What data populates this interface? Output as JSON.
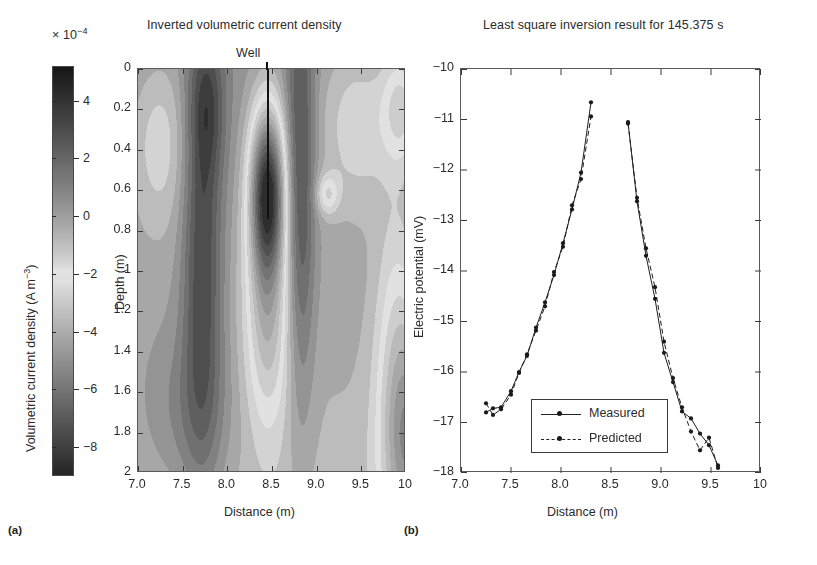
{
  "panels": {
    "a_label": "(a)",
    "b_label": "(b)"
  },
  "colorbar": {
    "exponent_prefix": "× 10",
    "exponent_value": "−4",
    "axis_label_main": "Volumetric current density (A m",
    "axis_label_exp": "−3",
    "axis_label_close": ")",
    "ticks": [
      "4",
      "2",
      "0",
      "−2",
      "−4",
      "−6",
      "−8"
    ],
    "tick_values": [
      4,
      2,
      0,
      -2,
      -4,
      -6,
      -8
    ],
    "range": [
      -9,
      5.2
    ]
  },
  "left": {
    "title": "Inverted volumetric current density",
    "well_label": "Well",
    "well_position_m": 8.45,
    "xlabel": "Distance (m)",
    "ylabel": "Depth (m)",
    "xticks": [
      "7.0",
      "7.5",
      "8.0",
      "8.5",
      "9.0",
      "9.5",
      "10"
    ],
    "xtick_values": [
      7.0,
      7.5,
      8.0,
      8.5,
      9.0,
      9.5,
      10.0
    ],
    "yticks": [
      "0",
      "0.2",
      "0.4",
      "0.6",
      "0.8",
      "1",
      "1.2",
      "1.4",
      "1.6",
      "1.8",
      "2"
    ],
    "ytick_values": [
      0,
      0.2,
      0.4,
      0.6,
      0.8,
      1.0,
      1.2,
      1.4,
      1.6,
      1.8,
      2.0
    ],
    "xlim": [
      7.0,
      10.0
    ],
    "ylim": [
      0,
      2
    ]
  },
  "right": {
    "title": "Least square inversion result for 145.375 s",
    "xlabel": "Distance (m)",
    "ylabel": "Electric potential (mV)",
    "xticks": [
      "7.0",
      "7.5",
      "8.0",
      "8.5",
      "9.0",
      "9.5",
      "10"
    ],
    "xtick_values": [
      7.0,
      7.5,
      8.0,
      8.5,
      9.0,
      9.5,
      10.0
    ],
    "yticks": [
      "−10",
      "−11",
      "−12",
      "−13",
      "−14",
      "−15",
      "−16",
      "−17",
      "−18"
    ],
    "ytick_values": [
      -10,
      -11,
      -12,
      -13,
      -14,
      -15,
      -16,
      -17,
      -18
    ],
    "xlim": [
      7.0,
      10.0
    ],
    "ylim": [
      -18,
      -10
    ],
    "legend": {
      "measured": "Measured",
      "predicted": "Predicted"
    }
  },
  "chart_data": [
    {
      "type": "heatmap",
      "title": "Inverted volumetric current density",
      "xlabel": "Distance (m)",
      "ylabel": "Depth (m)",
      "colorbar_label": "Volumetric current density (A m^-3)",
      "colorbar_exponent": "x 10^-4",
      "colorbar_ticks": [
        4,
        2,
        0,
        -2,
        -4,
        -6,
        -8
      ],
      "xlim": [
        7.0,
        10.0
      ],
      "ylim": [
        0,
        2
      ],
      "grid": false,
      "annotations": [
        {
          "text": "Well",
          "x": 8.45,
          "y": 0,
          "type": "vertical-line-marker"
        }
      ],
      "anomalies": [
        {
          "name": "primary-negative-anomaly",
          "x": 8.45,
          "depth": 0.6,
          "value": -8.5
        },
        {
          "name": "secondary-anomaly",
          "x": 9.12,
          "depth": 0.62,
          "value": -4.0
        }
      ],
      "field_nodes_x": [
        7.0,
        7.25,
        7.5,
        7.75,
        8.0,
        8.2,
        8.45,
        8.7,
        8.95,
        9.15,
        9.4,
        9.65,
        9.85,
        10.0
      ],
      "field_nodes_depth": [
        0,
        0.2,
        0.4,
        0.6,
        0.8,
        1.0,
        1.2,
        1.4,
        1.6,
        1.8,
        2.0
      ]
    },
    {
      "type": "line",
      "title": "Least square inversion result for 145.375 s",
      "xlabel": "Distance (m)",
      "ylabel": "Electric potential (mV)",
      "xlim": [
        7.0,
        10.0
      ],
      "ylim": [
        -18,
        -10
      ],
      "grid": false,
      "legend_position": "lower-center-left",
      "series": [
        {
          "name": "Measured",
          "style": "solid",
          "marker": "dot",
          "x": [
            7.25,
            7.32,
            7.4,
            7.5,
            7.58,
            7.66,
            7.75,
            7.84,
            7.93,
            8.02,
            8.11,
            8.2,
            8.3,
            8.67,
            8.76,
            8.85,
            8.94,
            9.03,
            9.12,
            9.21,
            9.3,
            9.39,
            9.48,
            9.57
          ],
          "y": [
            -16.8,
            -16.72,
            -16.7,
            -16.38,
            -16.0,
            -15.68,
            -15.12,
            -14.62,
            -14.08,
            -13.45,
            -12.78,
            -12.05,
            -10.66,
            -11.05,
            -12.62,
            -13.7,
            -14.55,
            -15.62,
            -16.2,
            -16.78,
            -16.92,
            -17.22,
            -17.45,
            -17.85
          ]
        },
        {
          "name": "Predicted",
          "style": "dashed",
          "marker": "dot",
          "x": [
            7.25,
            7.32,
            7.4,
            7.5,
            7.58,
            7.66,
            7.75,
            7.84,
            7.93,
            8.02,
            8.11,
            8.2,
            8.3,
            8.67,
            8.76,
            8.85,
            8.94,
            9.03,
            9.12,
            9.21,
            9.3,
            9.39,
            9.48,
            9.57
          ],
          "y": [
            -16.62,
            -16.85,
            -16.74,
            -16.45,
            -16.02,
            -15.65,
            -15.18,
            -14.7,
            -14.02,
            -13.52,
            -12.7,
            -12.18,
            -10.94,
            -11.08,
            -12.55,
            -13.55,
            -14.32,
            -15.4,
            -16.12,
            -16.7,
            -17.18,
            -17.55,
            -17.3,
            -17.9
          ]
        }
      ]
    }
  ]
}
